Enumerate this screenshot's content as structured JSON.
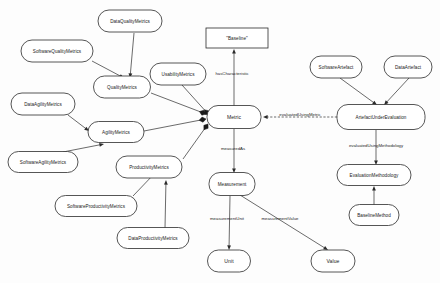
{
  "diagram": {
    "type": "ontology-class-diagram",
    "canvas": {
      "width": 440,
      "height": 283
    },
    "style": {
      "node_fill": "#ffffff",
      "node_stroke": "#2b2b2b",
      "text_color": "#1a1a1a",
      "edge_color": "#2b2b2b",
      "background": "#fdfdfd"
    },
    "nodes": [
      {
        "id": "DataQualityMetrics",
        "label": "DataQualityMetrics",
        "shape": "rounded",
        "x": 130,
        "y": 21,
        "w": 64,
        "h": 22
      },
      {
        "id": "SoftwareQualityMetrics",
        "label": "SoftwareQualityMetrics",
        "shape": "rounded",
        "x": 57,
        "y": 51,
        "w": 72,
        "h": 22
      },
      {
        "id": "QualityMetrics",
        "label": "QualityMetrics",
        "shape": "rounded",
        "x": 122,
        "y": 87,
        "w": 57,
        "h": 22
      },
      {
        "id": "DataAgilityMetrics",
        "label": "DataAgilityMetrics",
        "shape": "rounded",
        "x": 43,
        "y": 104,
        "w": 64,
        "h": 22
      },
      {
        "id": "AgilityMetrics",
        "label": "AgilityMetrics",
        "shape": "rounded",
        "x": 116,
        "y": 132,
        "w": 56,
        "h": 21
      },
      {
        "id": "SoftwareAgilityMetrics",
        "label": "SoftwareAgilityMetrics",
        "shape": "rounded",
        "x": 43,
        "y": 162,
        "w": 70,
        "h": 21
      },
      {
        "id": "UsabilityMetrics",
        "label": "UsabilityMetrics",
        "shape": "rounded",
        "x": 178,
        "y": 74,
        "w": 56,
        "h": 22
      },
      {
        "id": "ProductivityMetrics",
        "label": "ProductivityMetrics",
        "shape": "rounded",
        "x": 149,
        "y": 167,
        "w": 66,
        "h": 22
      },
      {
        "id": "SoftwareProductivityMetrics",
        "label": "SoftwareProductivityMetrics",
        "shape": "rounded",
        "x": 96,
        "y": 206,
        "w": 82,
        "h": 21
      },
      {
        "id": "DataProductivityMetrics",
        "label": "DataProductivityMetrics",
        "shape": "rounded",
        "x": 153,
        "y": 238,
        "w": 72,
        "h": 21
      },
      {
        "id": "Baseline",
        "label": "\"Baseline\"",
        "shape": "rect",
        "x": 237,
        "y": 38,
        "w": 62,
        "h": 20
      },
      {
        "id": "Metric",
        "label": "Metric",
        "shape": "rounded",
        "x": 234,
        "y": 117,
        "w": 54,
        "h": 23
      },
      {
        "id": "Measurement",
        "label": "Measurement",
        "shape": "rounded",
        "x": 232,
        "y": 184,
        "w": 46,
        "h": 23
      },
      {
        "id": "Unit",
        "label": "Unit",
        "shape": "rounded",
        "x": 229,
        "y": 261,
        "w": 43,
        "h": 22
      },
      {
        "id": "Value",
        "label": "Value",
        "shape": "rounded",
        "x": 333,
        "y": 261,
        "w": 44,
        "h": 22
      },
      {
        "id": "SoftwareArtefact",
        "label": "SoftwareArtefact",
        "shape": "rounded",
        "x": 336,
        "y": 67,
        "w": 52,
        "h": 22
      },
      {
        "id": "DataArtefact",
        "label": "DataArtefact",
        "shape": "rounded",
        "x": 408,
        "y": 67,
        "w": 48,
        "h": 22
      },
      {
        "id": "ArtefactUnderEvaluation",
        "label": "ArtefactUnderEvaluation",
        "shape": "rounded",
        "x": 381,
        "y": 117,
        "w": 88,
        "h": 25
      },
      {
        "id": "EvaluationMethodology",
        "label": "EvaluationMethodology",
        "shape": "rounded",
        "x": 374,
        "y": 175,
        "w": 74,
        "h": 21
      },
      {
        "id": "BaselineMethod",
        "label": "BaselineMethod",
        "shape": "rounded",
        "x": 374,
        "y": 215,
        "w": 50,
        "h": 21
      }
    ],
    "edges": [
      {
        "id": "e1",
        "from": "DataQualityMetrics",
        "to": "QualityMetrics",
        "label": "",
        "x1": 134,
        "y1": 33,
        "x2": 130,
        "y2": 78,
        "head": "arrow"
      },
      {
        "id": "e2",
        "from": "SoftwareQualityMetrics",
        "to": "QualityMetrics",
        "label": "",
        "x1": 92,
        "y1": 61,
        "x2": 124,
        "y2": 78,
        "head": "arrow"
      },
      {
        "id": "e3",
        "from": "QualityMetrics",
        "to": "Metric",
        "label": "",
        "x1": 151,
        "y1": 93,
        "x2": 206,
        "y2": 114,
        "head": "diamond"
      },
      {
        "id": "e4",
        "from": "DataAgilityMetrics",
        "to": "AgilityMetrics",
        "label": "",
        "x1": 68,
        "y1": 115,
        "x2": 89,
        "y2": 131,
        "head": "arrow"
      },
      {
        "id": "e5",
        "from": "SoftwareAgilityMetrics",
        "to": "AgilityMetrics",
        "label": "",
        "x1": 63,
        "y1": 152,
        "x2": 104,
        "y2": 144,
        "head": "arrow"
      },
      {
        "id": "e6",
        "from": "AgilityMetrics",
        "to": "Metric",
        "label": "",
        "x1": 144,
        "y1": 131,
        "x2": 206,
        "y2": 119,
        "head": "diamond"
      },
      {
        "id": "e7",
        "from": "UsabilityMetrics",
        "to": "Metric",
        "label": "",
        "x1": 182,
        "y1": 85,
        "x2": 209,
        "y2": 115,
        "head": "diamond"
      },
      {
        "id": "e8",
        "from": "ProductivityMetrics",
        "to": "Metric",
        "label": "",
        "x1": 183,
        "y1": 159,
        "x2": 208,
        "y2": 124,
        "head": "diamond"
      },
      {
        "id": "e9",
        "from": "SoftwareProductivityMetrics",
        "to": "ProductivityMetrics",
        "label": "",
        "x1": 133,
        "y1": 196,
        "x2": 155,
        "y2": 173,
        "head": "arrow"
      },
      {
        "id": "e10",
        "from": "DataProductivityMetrics",
        "to": "ProductivityMetrics",
        "label": "",
        "x1": 165,
        "y1": 228,
        "x2": 166,
        "y2": 180,
        "head": "arrow"
      },
      {
        "id": "e11",
        "from": "Metric",
        "to": "Baseline",
        "label": "hasCharacteristic",
        "x1": 234,
        "y1": 106,
        "x2": 234,
        "y2": 49,
        "head": "arrow",
        "lx": 232,
        "ly": 74
      },
      {
        "id": "e12",
        "from": "ArtefactUnderEvaluation",
        "to": "Metric",
        "label": "evaluatedUsingMetric",
        "x1": 337,
        "y1": 117,
        "x2": 263,
        "y2": 117,
        "head": "arrow",
        "lx": 300,
        "ly": 115,
        "dashed": true
      },
      {
        "id": "e13",
        "from": "Metric",
        "to": "Measurement",
        "label": "measuredAs",
        "x1": 234,
        "y1": 129,
        "x2": 234,
        "y2": 173,
        "head": "arrow",
        "lx": 233,
        "ly": 149
      },
      {
        "id": "e14",
        "from": "Measurement",
        "to": "Unit",
        "label": "measurementUnit",
        "x1": 230,
        "y1": 196,
        "x2": 229,
        "y2": 250,
        "head": "arrow",
        "lx": 227,
        "ly": 219
      },
      {
        "id": "e15",
        "from": "Measurement",
        "to": "Value",
        "label": "measurementValue",
        "x1": 240,
        "y1": 195,
        "x2": 328,
        "y2": 250,
        "head": "arrow",
        "lx": 280,
        "ly": 219
      },
      {
        "id": "e16",
        "from": "SoftwareArtefact",
        "to": "ArtefactUnderEvaluation",
        "label": "",
        "x1": 340,
        "y1": 78,
        "x2": 377,
        "y2": 105,
        "head": "arrow"
      },
      {
        "id": "e17",
        "from": "DataArtefact",
        "to": "ArtefactUnderEvaluation",
        "label": "",
        "x1": 409,
        "y1": 78,
        "x2": 384,
        "y2": 105,
        "head": "arrow"
      },
      {
        "id": "e18",
        "from": "ArtefactUnderEvaluation",
        "to": "EvaluationMethodology",
        "label": "evaluatedUsingMethodology",
        "x1": 376,
        "y1": 130,
        "x2": 376,
        "y2": 165,
        "head": "arrow",
        "lx": 376,
        "ly": 146
      },
      {
        "id": "e19",
        "from": "BaselineMethod",
        "to": "EvaluationMethodology",
        "label": "",
        "x1": 374,
        "y1": 205,
        "x2": 374,
        "y2": 186,
        "head": "arrow"
      }
    ]
  }
}
